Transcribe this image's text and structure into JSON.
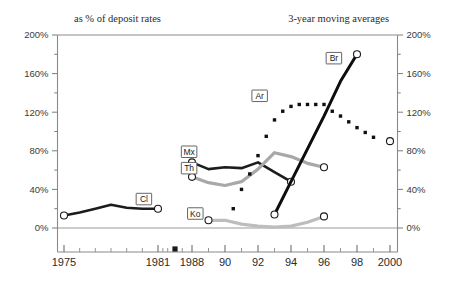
{
  "chart_data": {
    "type": "line",
    "title": "",
    "subtitle_left": "as % of deposit rates",
    "subtitle_right": "3-year moving averages",
    "xlabel": "",
    "ylabel": "",
    "ylim": [
      0,
      200
    ],
    "y_unit": "%",
    "grid": false,
    "legend": "inline-labels",
    "y_ticks": [
      "0%",
      "40%",
      "80%",
      "120%",
      "160%",
      "200%"
    ],
    "y_tick_values": [
      0,
      40,
      80,
      120,
      160,
      200
    ],
    "y_minor_step": 20,
    "x_ticks": [
      "1975",
      "1981",
      "1988",
      "90",
      "92",
      "94",
      "96",
      "98",
      "2000"
    ],
    "x_tick_values": [
      1975,
      1981,
      1988,
      1990,
      1992,
      1994,
      1996,
      1998,
      2000
    ],
    "x_axis_break_marker": true,
    "x_axis_break_value": 1984.5,
    "axis_note": "axis uses compressed scale before 1988",
    "series": [
      {
        "name": "Cl",
        "label": "Cl",
        "style": "solid",
        "color": "#1c1c1c",
        "width": 2.6,
        "marker_start": true,
        "marker_end": true,
        "label_x": 1980.1,
        "label_y": 30,
        "x": [
          1975,
          1976,
          1977,
          1978,
          1979,
          1980,
          1981
        ],
        "values": [
          13,
          16,
          20,
          24,
          21,
          20,
          20
        ]
      },
      {
        "name": "Mx",
        "label": "Mx",
        "style": "solid",
        "color": "#1c1c1c",
        "width": 2.6,
        "marker_start": true,
        "marker_end": true,
        "label_x": 1987.4,
        "label_y": 79,
        "x": [
          1988,
          1989,
          1990,
          1991,
          1992,
          1993,
          1994
        ],
        "values": [
          68,
          61,
          63,
          62,
          68,
          58,
          48
        ]
      },
      {
        "name": "Th",
        "label": "Th",
        "style": "solid",
        "color": "#a8a8a8",
        "width": 3.2,
        "marker_start": true,
        "marker_end": true,
        "label_x": 1987.4,
        "label_y": 62,
        "x": [
          1988,
          1989,
          1990,
          1991,
          1992,
          1993,
          1994,
          1995,
          1996
        ],
        "values": [
          53,
          47,
          44,
          48,
          61,
          78,
          74,
          67,
          63
        ]
      },
      {
        "name": "Ko",
        "label": "Ko",
        "style": "solid",
        "color": "#bdbdbd",
        "width": 3.2,
        "marker_start": true,
        "marker_end": true,
        "label_x": 1988.2,
        "label_y": 15,
        "x": [
          1989,
          1990,
          1991,
          1992,
          1993,
          1994,
          1995,
          1996
        ],
        "values": [
          8,
          8,
          4,
          2,
          1,
          2,
          6,
          12
        ]
      },
      {
        "name": "Ar",
        "label": "Ar",
        "style": "dotted",
        "color": "#101010",
        "width": 3.4,
        "marker_start": false,
        "marker_end": true,
        "label_x": 1992.1,
        "label_y": 137,
        "x": [
          1990.5,
          1991,
          1991.5,
          1992,
          1992.5,
          1993,
          1993.5,
          1994,
          1994.5,
          1995,
          1995.5,
          1996,
          1996.5,
          1997,
          1997.5,
          1998,
          1998.5,
          1999,
          2000
        ],
        "values": [
          20,
          40,
          56,
          75,
          95,
          112,
          121,
          126,
          128,
          128,
          128,
          128,
          121,
          116,
          110,
          104,
          99,
          94,
          90
        ]
      },
      {
        "name": "Br",
        "label": "Br",
        "style": "solid",
        "color": "#0d0d0d",
        "width": 3.0,
        "marker_start": true,
        "marker_end": true,
        "label_x": 1996.6,
        "label_y": 176,
        "x": [
          1993,
          1994,
          1995,
          1996,
          1997,
          1998
        ],
        "values": [
          14,
          48,
          82,
          116,
          152,
          180
        ]
      }
    ]
  }
}
